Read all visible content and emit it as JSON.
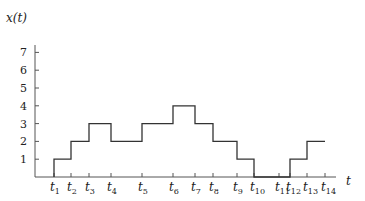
{
  "chart_data": {
    "type": "line",
    "subtype": "step",
    "title": "",
    "ylabel": "x(t)",
    "xlabel": "t",
    "ylim": [
      0,
      7.5
    ],
    "yticks": [
      1,
      2,
      3,
      4,
      5,
      6,
      7
    ],
    "grid": false,
    "legend": null,
    "x_ticks": [
      {
        "label": "t",
        "sub": "1"
      },
      {
        "label": "t",
        "sub": "2"
      },
      {
        "label": "t",
        "sub": "3"
      },
      {
        "label": "t",
        "sub": "4"
      },
      {
        "label": "t",
        "sub": "5"
      },
      {
        "label": "t",
        "sub": "6"
      },
      {
        "label": "t",
        "sub": "7"
      },
      {
        "label": "t",
        "sub": "8"
      },
      {
        "label": "t",
        "sub": "9"
      },
      {
        "label": "t",
        "sub": "10"
      },
      {
        "label": "t",
        "sub": "11"
      },
      {
        "label": "t",
        "sub": "12"
      },
      {
        "label": "t",
        "sub": "13"
      },
      {
        "label": "t",
        "sub": "14"
      }
    ],
    "x_tick_px": [
      54,
      71,
      89,
      111,
      142,
      173,
      195,
      213,
      237,
      254,
      279,
      290,
      307,
      325
    ],
    "segments": [
      {
        "from": "t1",
        "to": "t2",
        "value": 1
      },
      {
        "from": "t2",
        "to": "t3",
        "value": 2
      },
      {
        "from": "t3",
        "to": "t4",
        "value": 3
      },
      {
        "from": "t4",
        "to": "t5",
        "value": 2
      },
      {
        "from": "t5",
        "to": "t6",
        "value": 3
      },
      {
        "from": "t6",
        "to": "t7",
        "value": 4
      },
      {
        "from": "t7",
        "to": "t8",
        "value": 3
      },
      {
        "from": "t8",
        "to": "t9",
        "value": 2
      },
      {
        "from": "t9",
        "to": "t10",
        "value": 1
      },
      {
        "from": "t10",
        "to": "t12",
        "value": 0
      },
      {
        "from": "t12",
        "to": "t13",
        "value": 1
      },
      {
        "from": "t13",
        "to": "t14",
        "value": 2
      }
    ],
    "values_by_interval": [
      1,
      2,
      3,
      2,
      3,
      4,
      3,
      2,
      1,
      0,
      0,
      1,
      2
    ]
  },
  "colors": {
    "line": "#333333",
    "axis": "#555555",
    "text": "#222222"
  }
}
